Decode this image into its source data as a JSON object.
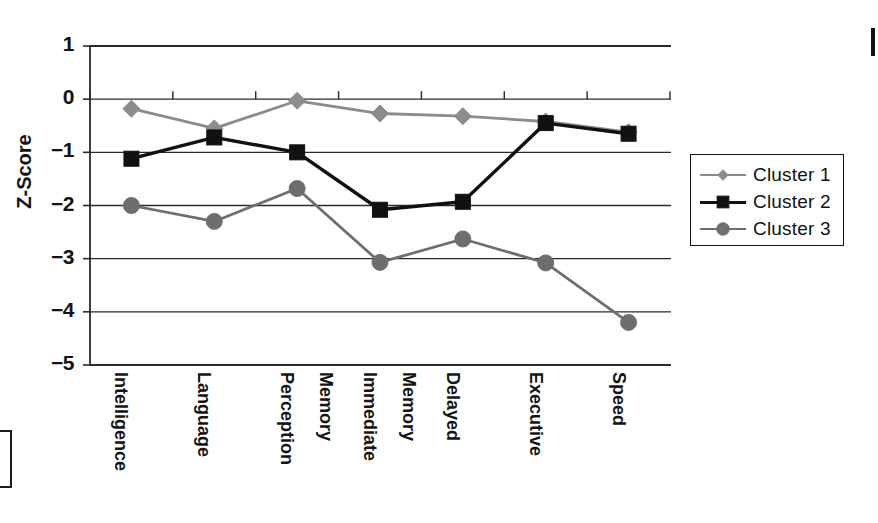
{
  "chart_data": {
    "type": "line",
    "title": "",
    "xlabel": "",
    "ylabel": "Z-Score",
    "ylim": [
      -5,
      1
    ],
    "yticks": [
      1,
      0,
      -1,
      -2,
      -3,
      -4,
      -5
    ],
    "ytick_labels": [
      "1",
      "0",
      "−1",
      "−2",
      "−3",
      "−4",
      "−5"
    ],
    "grid": true,
    "legend_position": "right",
    "categories": [
      "Intelligence",
      "Language",
      "Perception",
      "Immediate Memory",
      "Delayed Memory",
      "Executive",
      "Speed"
    ],
    "category_lines": [
      [
        "Intelligence"
      ],
      [
        "Language"
      ],
      [
        "Perception"
      ],
      [
        "Immediate",
        "Memory"
      ],
      [
        "Delayed",
        "Memory"
      ],
      [
        "Executive"
      ],
      [
        "Speed"
      ]
    ],
    "series": [
      {
        "name": "Cluster 1",
        "marker": "diamond",
        "color": "#8c8c8c",
        "values": [
          -0.18,
          -0.55,
          -0.03,
          -0.27,
          -0.32,
          -0.42,
          -0.62
        ]
      },
      {
        "name": "Cluster 2",
        "marker": "square",
        "color": "#111111",
        "values": [
          -1.12,
          -0.72,
          -1.0,
          -2.08,
          -1.93,
          -0.45,
          -0.65
        ]
      },
      {
        "name": "Cluster 3",
        "marker": "circle",
        "color": "#6e6e6e",
        "values": [
          -2.0,
          -2.3,
          -1.68,
          -3.07,
          -2.63,
          -3.08,
          -4.2
        ]
      }
    ]
  },
  "legend": {
    "items": [
      {
        "label": "Cluster 1"
      },
      {
        "label": "Cluster 2"
      },
      {
        "label": "Cluster 3"
      }
    ]
  },
  "axis": {
    "y_title": "Z-Score"
  }
}
